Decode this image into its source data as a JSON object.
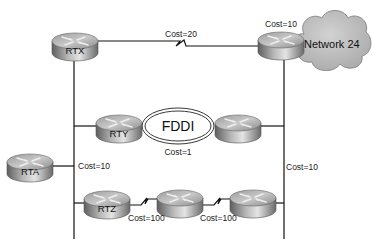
{
  "diagram": {
    "title": "",
    "routers": [
      {
        "id": "rtx",
        "label": "RTX"
      },
      {
        "id": "rtn24",
        "label": ""
      },
      {
        "id": "rty",
        "label": "RTY"
      },
      {
        "id": "rtfddi2",
        "label": ""
      },
      {
        "id": "rta",
        "label": "RTA"
      },
      {
        "id": "rtz",
        "label": "RTZ"
      },
      {
        "id": "rtz2",
        "label": ""
      },
      {
        "id": "rtz3",
        "label": ""
      }
    ],
    "networks": {
      "cloud": "Network 24",
      "ring": "FDDI"
    },
    "links": [
      {
        "from": "rtx",
        "to": "rtn24",
        "type": "serial",
        "cost_label": "Cost=20"
      },
      {
        "from": "rtn24",
        "to": "Network 24",
        "type": "lan",
        "cost_label": "Cost=10"
      },
      {
        "from": "rty",
        "to": "rtfddi2",
        "type": "fddi",
        "cost_label": "Cost=1"
      },
      {
        "from": "rta",
        "to": "left-lan",
        "type": "lan",
        "cost_label": "Cost=10"
      },
      {
        "from": "rtn24",
        "to": "right-lan",
        "type": "lan",
        "cost_label": "Cost=10"
      },
      {
        "from": "rtz",
        "to": "rtz2",
        "type": "serial",
        "cost_label": "Cost=100"
      },
      {
        "from": "rtz2",
        "to": "rtz3",
        "type": "serial",
        "cost_label": "Cost=100"
      }
    ]
  }
}
